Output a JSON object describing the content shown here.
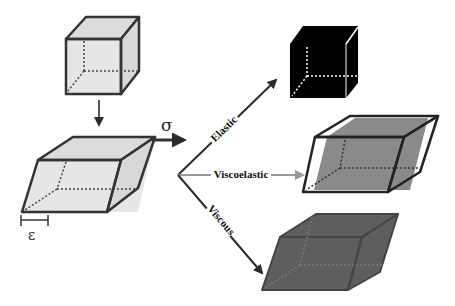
{
  "figure": {
    "stress_symbol": "σ",
    "strain_symbol": "ε",
    "branches": [
      {
        "label": "Elastic",
        "result": "black cube (full shape recovery)"
      },
      {
        "label": "Viscoelastic",
        "result": "partially sheared gray block inside outline"
      },
      {
        "label": "Viscous",
        "result": "permanently sheared dark gray block"
      }
    ]
  },
  "colors": {
    "light_fill": "#e6e6e6",
    "edge": "#333333",
    "elastic_fill": "#000000",
    "visco_fill": "#8a8a8a",
    "viscous_fill": "#5e5e5e",
    "arrow": "#2b2b2b",
    "viscoelastic_arrow": "#9a9a9a"
  }
}
